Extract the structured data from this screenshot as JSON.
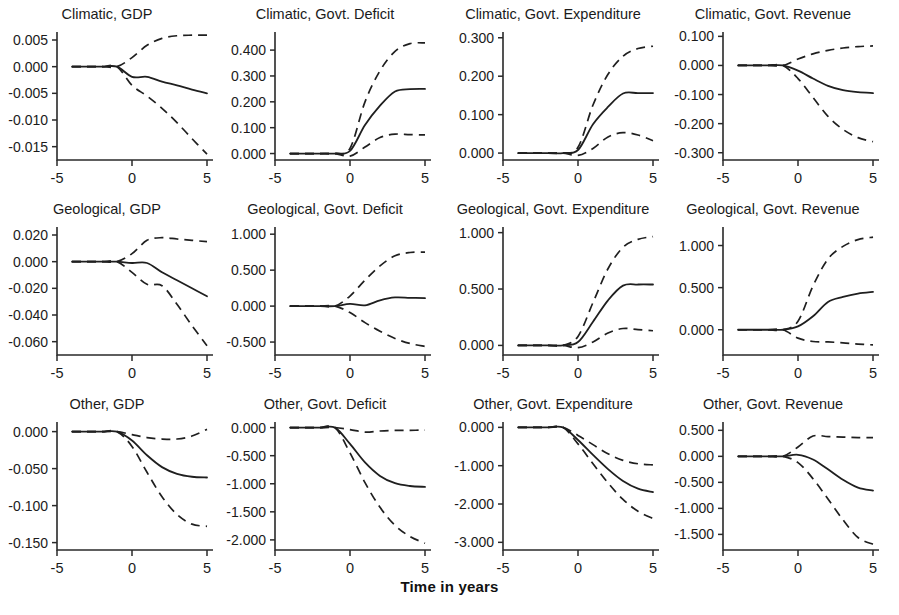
{
  "figure": {
    "xlabel": "Time in years",
    "rows": [
      "Climatic",
      "Geological",
      "Other"
    ],
    "columns": [
      "GDP",
      "Govt. Deficit",
      "Govt. Expenditure",
      "Govt. Revenue"
    ],
    "x_ticks": [
      "-5",
      "0",
      "5"
    ],
    "line_color": "#1f1f1f"
  },
  "chart_data": [
    {
      "type": "line",
      "title": "Climatic, GDP",
      "xlabel": "Time in years",
      "ylabel": "",
      "xlim": [
        -5,
        5
      ],
      "ylim": [
        -0.0175,
        0.0065
      ],
      "x_ticks": [
        -5,
        0,
        5
      ],
      "y_ticks": [
        0.005,
        0.0,
        -0.005,
        -0.01,
        -0.015
      ],
      "y_tick_labels": [
        "0.005",
        "0.000",
        "-0.005",
        "-0.010",
        "-0.015"
      ],
      "grid": false,
      "legend": "none",
      "x": [
        -4,
        -3,
        -2,
        -1,
        0,
        1,
        2,
        3,
        4,
        5
      ],
      "series": [
        {
          "name": "median",
          "style": "solid",
          "values": [
            0.0,
            0.0,
            0.0,
            0.0,
            -0.0019,
            -0.0019,
            -0.0028,
            -0.0035,
            -0.0043,
            -0.005
          ]
        },
        {
          "name": "upper band",
          "style": "dashed",
          "values": [
            0.0,
            0.0,
            0.0,
            0.0,
            0.0017,
            0.004,
            0.0053,
            0.0058,
            0.0059,
            0.0059
          ]
        },
        {
          "name": "lower band",
          "style": "dashed",
          "values": [
            0.0,
            0.0,
            0.0,
            0.0,
            -0.0035,
            -0.0055,
            -0.0078,
            -0.0105,
            -0.0135,
            -0.0164
          ]
        }
      ]
    },
    {
      "type": "line",
      "title": "Climatic, Govt. Deficit",
      "xlabel": "Time in years",
      "ylabel": "",
      "xlim": [
        -5,
        5
      ],
      "ylim": [
        -0.025,
        0.47
      ],
      "x_ticks": [
        -5,
        0,
        5
      ],
      "y_ticks": [
        0.4,
        0.3,
        0.2,
        0.1,
        0.0
      ],
      "y_tick_labels": [
        "0.400",
        "0.300",
        "0.200",
        "0.100",
        "0.000"
      ],
      "grid": false,
      "legend": "none",
      "x": [
        -4,
        -3,
        -2,
        -1,
        0,
        1,
        2,
        3,
        4,
        5
      ],
      "series": [
        {
          "name": "median",
          "style": "solid",
          "values": [
            0.0,
            0.0,
            0.0,
            0.0,
            0.01,
            0.11,
            0.185,
            0.24,
            0.249,
            0.25
          ]
        },
        {
          "name": "upper band",
          "style": "dashed",
          "values": [
            0.0,
            0.0,
            0.0,
            0.0,
            0.02,
            0.2,
            0.32,
            0.395,
            0.425,
            0.428
          ]
        },
        {
          "name": "lower band",
          "style": "dashed",
          "values": [
            0.0,
            0.0,
            0.0,
            0.0,
            -0.01,
            0.025,
            0.062,
            0.075,
            0.073,
            0.072
          ]
        }
      ]
    },
    {
      "type": "line",
      "title": "Climatic, Govt. Expenditure",
      "xlabel": "Time in years",
      "ylabel": "",
      "xlim": [
        -5,
        5
      ],
      "ylim": [
        -0.018,
        0.315
      ],
      "x_ticks": [
        -5,
        0,
        5
      ],
      "y_ticks": [
        0.3,
        0.2,
        0.1,
        0.0
      ],
      "y_tick_labels": [
        "0.300",
        "0.200",
        "0.100",
        "0.000"
      ],
      "grid": false,
      "legend": "none",
      "x": [
        -4,
        -3,
        -2,
        -1,
        0,
        1,
        2,
        3,
        4,
        5
      ],
      "series": [
        {
          "name": "median",
          "style": "solid",
          "values": [
            0.0,
            0.0,
            0.0,
            0.0,
            0.008,
            0.075,
            0.12,
            0.155,
            0.156,
            0.156
          ]
        },
        {
          "name": "upper band",
          "style": "dashed",
          "values": [
            0.0,
            0.0,
            0.0,
            0.0,
            0.015,
            0.125,
            0.205,
            0.252,
            0.272,
            0.278
          ]
        },
        {
          "name": "lower band",
          "style": "dashed",
          "values": [
            0.0,
            0.0,
            0.0,
            0.0,
            -0.006,
            0.012,
            0.042,
            0.053,
            0.047,
            0.032
          ]
        }
      ]
    },
    {
      "type": "line",
      "title": "Climatic, Govt. Revenue",
      "xlabel": "Time in years",
      "ylabel": "",
      "xlim": [
        -5,
        5
      ],
      "ylim": [
        -0.325,
        0.115
      ],
      "x_ticks": [
        -5,
        0,
        5
      ],
      "y_ticks": [
        0.1,
        0.0,
        -0.1,
        -0.2,
        -0.3
      ],
      "y_tick_labels": [
        "0.100",
        "0.000",
        "-0.100",
        "-0.200",
        "-0.300"
      ],
      "grid": false,
      "legend": "none",
      "x": [
        -4,
        -3,
        -2,
        -1,
        0,
        1,
        2,
        3,
        4,
        5
      ],
      "series": [
        {
          "name": "median",
          "style": "solid",
          "values": [
            0.0,
            0.0,
            0.0,
            0.0,
            -0.018,
            -0.045,
            -0.07,
            -0.085,
            -0.092,
            -0.095
          ]
        },
        {
          "name": "upper band",
          "style": "dashed",
          "values": [
            0.0,
            0.0,
            0.0,
            0.0,
            0.022,
            0.04,
            0.052,
            0.06,
            0.065,
            0.067
          ]
        },
        {
          "name": "lower band",
          "style": "dashed",
          "values": [
            0.0,
            0.0,
            0.0,
            0.0,
            -0.045,
            -0.11,
            -0.175,
            -0.22,
            -0.248,
            -0.262
          ]
        }
      ]
    },
    {
      "type": "line",
      "title": "Geological, GDP",
      "xlabel": "Time in years",
      "ylabel": "",
      "xlim": [
        -5,
        5
      ],
      "ylim": [
        -0.07,
        0.026
      ],
      "x_ticks": [
        -5,
        0,
        5
      ],
      "y_ticks": [
        0.02,
        0.0,
        -0.02,
        -0.04,
        -0.06
      ],
      "y_tick_labels": [
        "0.020",
        "0.000",
        "-0.020",
        "-0.040",
        "-0.060"
      ],
      "grid": false,
      "legend": "none",
      "x": [
        -4,
        -3,
        -2,
        -1,
        0,
        1,
        2,
        3,
        4,
        5
      ],
      "series": [
        {
          "name": "median",
          "style": "solid",
          "values": [
            0.0,
            0.0,
            0.0,
            0.0,
            -0.001,
            -0.001,
            -0.008,
            -0.014,
            -0.02,
            -0.026
          ]
        },
        {
          "name": "upper band",
          "style": "dashed",
          "values": [
            0.0,
            0.0,
            0.0,
            0.0,
            0.006,
            0.016,
            0.018,
            0.017,
            0.016,
            0.015
          ]
        },
        {
          "name": "lower band",
          "style": "dashed",
          "values": [
            0.0,
            0.0,
            0.0,
            0.0,
            -0.008,
            -0.017,
            -0.018,
            -0.032,
            -0.048,
            -0.063
          ]
        }
      ]
    },
    {
      "type": "line",
      "title": "Geological, Govt. Deficit",
      "xlabel": "Time in years",
      "ylabel": "",
      "xlim": [
        -5,
        5
      ],
      "ylim": [
        -0.68,
        1.1
      ],
      "x_ticks": [
        -5,
        0,
        5
      ],
      "y_ticks": [
        1.0,
        0.5,
        0.0,
        -0.5
      ],
      "y_tick_labels": [
        "1.000",
        "0.500",
        "0.000",
        "-0.500"
      ],
      "grid": false,
      "legend": "none",
      "x": [
        -4,
        -3,
        -2,
        -1,
        0,
        1,
        2,
        3,
        4,
        5
      ],
      "series": [
        {
          "name": "median",
          "style": "solid",
          "values": [
            0.0,
            0.0,
            0.0,
            0.0,
            0.03,
            0.01,
            0.08,
            0.12,
            0.115,
            0.11
          ]
        },
        {
          "name": "upper band",
          "style": "dashed",
          "values": [
            0.0,
            0.0,
            0.0,
            0.0,
            0.14,
            0.36,
            0.56,
            0.7,
            0.745,
            0.75
          ]
        },
        {
          "name": "lower band",
          "style": "dashed",
          "values": [
            0.0,
            0.0,
            0.0,
            0.0,
            -0.09,
            -0.23,
            -0.35,
            -0.45,
            -0.52,
            -0.56
          ]
        }
      ]
    },
    {
      "type": "line",
      "title": "Geological, Govt. Expenditure",
      "xlabel": "Time in years",
      "ylabel": "",
      "xlim": [
        -5,
        5
      ],
      "ylim": [
        -0.085,
        1.05
      ],
      "x_ticks": [
        -5,
        0,
        5
      ],
      "y_ticks": [
        1.0,
        0.5,
        0.0
      ],
      "y_tick_labels": [
        "1.000",
        "0.500",
        "0.000"
      ],
      "grid": false,
      "legend": "none",
      "x": [
        -4,
        -3,
        -2,
        -1,
        0,
        1,
        2,
        3,
        4,
        5
      ],
      "series": [
        {
          "name": "median",
          "style": "solid",
          "values": [
            0.0,
            0.0,
            0.0,
            0.0,
            0.03,
            0.21,
            0.4,
            0.53,
            0.54,
            0.54
          ]
        },
        {
          "name": "upper band",
          "style": "dashed",
          "values": [
            0.0,
            0.0,
            0.0,
            0.0,
            0.08,
            0.38,
            0.68,
            0.87,
            0.94,
            0.965
          ]
        },
        {
          "name": "lower band",
          "style": "dashed",
          "values": [
            0.0,
            0.0,
            0.0,
            0.0,
            -0.02,
            0.03,
            0.11,
            0.15,
            0.14,
            0.13
          ]
        }
      ]
    },
    {
      "type": "line",
      "title": "Geological, Govt. Revenue",
      "xlabel": "Time in years",
      "ylabel": "",
      "xlim": [
        -5,
        5
      ],
      "ylim": [
        -0.3,
        1.22
      ],
      "x_ticks": [
        -5,
        0,
        5
      ],
      "y_ticks": [
        1.0,
        0.5,
        0.0
      ],
      "y_tick_labels": [
        "1.000",
        "0.500",
        "0.000"
      ],
      "grid": false,
      "legend": "none",
      "x": [
        -4,
        -3,
        -2,
        -1,
        0,
        1,
        2,
        3,
        4,
        5
      ],
      "series": [
        {
          "name": "median",
          "style": "solid",
          "values": [
            0.0,
            0.0,
            0.0,
            0.0,
            0.04,
            0.16,
            0.33,
            0.39,
            0.43,
            0.45
          ]
        },
        {
          "name": "upper band",
          "style": "dashed",
          "values": [
            0.0,
            0.0,
            0.0,
            0.0,
            0.1,
            0.52,
            0.84,
            0.99,
            1.07,
            1.1
          ]
        },
        {
          "name": "lower band",
          "style": "dashed",
          "values": [
            0.0,
            0.0,
            0.0,
            0.0,
            -0.1,
            -0.14,
            -0.145,
            -0.155,
            -0.17,
            -0.18
          ]
        }
      ]
    },
    {
      "type": "line",
      "title": "Other, GDP",
      "xlabel": "Time in years",
      "ylabel": "",
      "xlim": [
        -5,
        5
      ],
      "ylim": [
        -0.16,
        0.013
      ],
      "x_ticks": [
        -5,
        0,
        5
      ],
      "y_ticks": [
        0.0,
        -0.05,
        -0.1,
        -0.15
      ],
      "y_tick_labels": [
        "0.000",
        "-0.050",
        "-0.100",
        "-0.150"
      ],
      "grid": false,
      "legend": "none",
      "x": [
        -4,
        -3,
        -2,
        -1,
        0,
        1,
        2,
        3,
        4,
        5
      ],
      "series": [
        {
          "name": "median",
          "style": "solid",
          "values": [
            0.0,
            0.0,
            0.0,
            0.0,
            -0.012,
            -0.032,
            -0.048,
            -0.057,
            -0.061,
            -0.062
          ]
        },
        {
          "name": "upper band",
          "style": "dashed",
          "values": [
            0.0,
            0.0,
            0.0,
            0.0,
            -0.004,
            -0.008,
            -0.01,
            -0.01,
            -0.006,
            0.003
          ]
        },
        {
          "name": "lower band",
          "style": "dashed",
          "values": [
            0.0,
            0.0,
            0.0,
            0.0,
            -0.02,
            -0.055,
            -0.088,
            -0.112,
            -0.125,
            -0.128
          ]
        }
      ]
    },
    {
      "type": "line",
      "title": "Other, Govt. Deficit",
      "xlabel": "Time in years",
      "ylabel": "",
      "xlim": [
        -5,
        5
      ],
      "ylim": [
        -2.18,
        0.1
      ],
      "x_ticks": [
        -5,
        0,
        5
      ],
      "y_ticks": [
        0.0,
        -0.5,
        -1.0,
        -1.5,
        -2.0
      ],
      "y_tick_labels": [
        "0.000",
        "-0.500",
        "-1.000",
        "-1.500",
        "-2.000"
      ],
      "grid": false,
      "legend": "none",
      "x": [
        -4,
        -3,
        -2,
        -1,
        0,
        1,
        2,
        3,
        4,
        5
      ],
      "series": [
        {
          "name": "median",
          "style": "solid",
          "values": [
            0.0,
            0.0,
            0.0,
            0.0,
            -0.29,
            -0.62,
            -0.86,
            -0.99,
            -1.04,
            -1.055
          ]
        },
        {
          "name": "upper band",
          "style": "dashed",
          "values": [
            0.0,
            0.0,
            0.0,
            0.0,
            -0.035,
            -0.08,
            -0.06,
            -0.05,
            -0.048,
            -0.045
          ]
        },
        {
          "name": "lower band",
          "style": "dashed",
          "values": [
            0.0,
            0.0,
            0.0,
            0.0,
            -0.45,
            -0.98,
            -1.42,
            -1.74,
            -1.94,
            -2.06
          ]
        }
      ]
    },
    {
      "type": "line",
      "title": "Other, Govt. Expenditure",
      "xlabel": "Time in years",
      "ylabel": "",
      "xlim": [
        -5,
        5
      ],
      "ylim": [
        -3.2,
        0.14
      ],
      "x_ticks": [
        -5,
        0,
        5
      ],
      "y_ticks": [
        0.0,
        -1.0,
        -2.0,
        -3.0
      ],
      "y_tick_labels": [
        "0.000",
        "-1.000",
        "-2.000",
        "-3.000"
      ],
      "grid": false,
      "legend": "none",
      "x": [
        -4,
        -3,
        -2,
        -1,
        0,
        1,
        2,
        3,
        4,
        5
      ],
      "series": [
        {
          "name": "median",
          "style": "solid",
          "values": [
            0.0,
            0.0,
            0.0,
            0.0,
            -0.33,
            -0.72,
            -1.09,
            -1.4,
            -1.6,
            -1.69
          ]
        },
        {
          "name": "upper band",
          "style": "dashed",
          "values": [
            0.0,
            0.0,
            0.0,
            0.0,
            -0.21,
            -0.45,
            -0.69,
            -0.86,
            -0.95,
            -0.98
          ]
        },
        {
          "name": "lower band",
          "style": "dashed",
          "values": [
            0.0,
            0.0,
            0.0,
            0.0,
            -0.43,
            -0.95,
            -1.45,
            -1.88,
            -2.19,
            -2.38
          ]
        }
      ]
    },
    {
      "type": "line",
      "title": "Other, Govt. Revenue",
      "xlabel": "Time in years",
      "ylabel": "",
      "xlim": [
        -5,
        5
      ],
      "ylim": [
        -1.8,
        0.66
      ],
      "x_ticks": [
        -5,
        0,
        5
      ],
      "y_ticks": [
        0.5,
        0.0,
        -0.5,
        -1.0,
        -1.5
      ],
      "y_tick_labels": [
        "0.500",
        "0.000",
        "-0.500",
        "-1.000",
        "-1.500"
      ],
      "grid": false,
      "legend": "none",
      "x": [
        -4,
        -3,
        -2,
        -1,
        0,
        1,
        2,
        3,
        4,
        5
      ],
      "series": [
        {
          "name": "median",
          "style": "solid",
          "values": [
            0.0,
            0.0,
            0.0,
            0.0,
            0.03,
            -0.06,
            -0.25,
            -0.45,
            -0.6,
            -0.66
          ]
        },
        {
          "name": "upper band",
          "style": "dashed",
          "values": [
            0.0,
            0.0,
            0.0,
            0.0,
            0.18,
            0.39,
            0.38,
            0.37,
            0.36,
            0.36
          ]
        },
        {
          "name": "lower band",
          "style": "dashed",
          "values": [
            0.0,
            0.0,
            0.0,
            0.0,
            -0.12,
            -0.43,
            -0.82,
            -1.22,
            -1.56,
            -1.69
          ]
        }
      ]
    }
  ]
}
